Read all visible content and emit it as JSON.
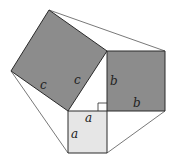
{
  "diagram": {
    "colors": {
      "square_c": "#8c8c8c",
      "square_b": "#8c8c8c",
      "square_a": "#e6e6e6",
      "stroke": "#2a2a2a",
      "connector": "#555555",
      "background": "#ffffff"
    },
    "squares": {
      "c": {
        "points": "49,10 107,51 68,111 11,71"
      },
      "b": {
        "points": "107,51 165,51 165,111 107,111"
      },
      "a": {
        "points": "68,111 107,111 107,153 68,153"
      }
    },
    "connectors": [
      {
        "x1": 49,
        "y1": 10,
        "x2": 165,
        "y2": 51
      },
      {
        "x1": 11,
        "y1": 71,
        "x2": 68,
        "y2": 153
      },
      {
        "x1": 165,
        "y1": 111,
        "x2": 107,
        "y2": 153
      }
    ],
    "right_angle_marker": {
      "x": 98,
      "y": 103,
      "size": 8
    },
    "labels": [
      {
        "id": "c-left",
        "text": "c",
        "x": 40,
        "y": 89
      },
      {
        "id": "c-right",
        "text": "c",
        "x": 74,
        "y": 84
      },
      {
        "id": "b-left",
        "text": "b",
        "x": 110,
        "y": 85
      },
      {
        "id": "b-bottom",
        "text": "b",
        "x": 133,
        "y": 107
      },
      {
        "id": "a-top",
        "text": "a",
        "x": 85,
        "y": 122
      },
      {
        "id": "a-left",
        "text": "a",
        "x": 71,
        "y": 138
      }
    ]
  }
}
